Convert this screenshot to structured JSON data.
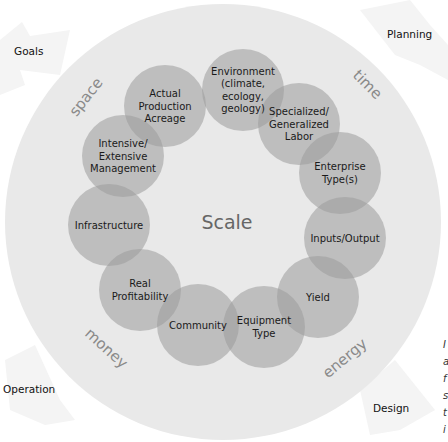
{
  "diagram": {
    "center_label": "Scale",
    "colors": {
      "background": "#ffffff",
      "outer_circle": "#e9e9e9",
      "node_fill": "#b8b8b8",
      "corner_arrow": "#f3f3f3",
      "dimension_text": "#8a8a8a",
      "center_text": "#666666"
    },
    "outer_circle": {
      "cx": 223,
      "cy": 222,
      "r": 218
    },
    "nodes": [
      {
        "id": "environment",
        "lines": [
          "Environment",
          "(climate,",
          "ecology,",
          "geology)"
        ],
        "cx": 243,
        "cy": 90
      },
      {
        "id": "labor",
        "lines": [
          "Specialized/",
          "Generalized",
          "Labor"
        ],
        "cx": 299,
        "cy": 124
      },
      {
        "id": "enterprise",
        "lines": [
          "Enterprise",
          "Type(s)"
        ],
        "cx": 340,
        "cy": 173
      },
      {
        "id": "inputs-output",
        "lines": [
          "Inputs/Output"
        ],
        "cx": 345,
        "cy": 238
      },
      {
        "id": "yield",
        "lines": [
          "Yield"
        ],
        "cx": 318,
        "cy": 297
      },
      {
        "id": "equipment",
        "lines": [
          "Equipment",
          "Type"
        ],
        "cx": 264,
        "cy": 327
      },
      {
        "id": "community",
        "lines": [
          "Community"
        ],
        "cx": 198,
        "cy": 325
      },
      {
        "id": "profitability",
        "lines": [
          "Real",
          "Profitability"
        ],
        "cx": 140,
        "cy": 290
      },
      {
        "id": "infrastructure",
        "lines": [
          "Infrastructure"
        ],
        "cx": 109,
        "cy": 225
      },
      {
        "id": "management",
        "lines": [
          "Intensive/",
          "Extensive",
          "Management"
        ],
        "cx": 123,
        "cy": 156
      },
      {
        "id": "acreage",
        "lines": [
          "Actual",
          "Production",
          "Acreage"
        ],
        "cx": 165,
        "cy": 106
      }
    ],
    "node_radius": 41,
    "dimensions": [
      {
        "label": "space",
        "x": 90,
        "y": 100,
        "rotate": -52
      },
      {
        "label": "time",
        "x": 364,
        "y": 88,
        "rotate": 45
      },
      {
        "label": "money",
        "x": 103,
        "y": 352,
        "rotate": 42
      },
      {
        "label": "energy",
        "x": 348,
        "y": 362,
        "rotate": -40
      }
    ],
    "corners": [
      {
        "label": "Goals",
        "x": 14,
        "y": 55
      },
      {
        "label": "Planning",
        "x": 387,
        "y": 38
      },
      {
        "label": "Operation",
        "x": 3,
        "y": 393
      },
      {
        "label": "Design",
        "x": 373,
        "y": 412
      }
    ],
    "right_edge_fragments": [
      "I",
      "a",
      "f",
      "s",
      "t",
      "i"
    ]
  }
}
